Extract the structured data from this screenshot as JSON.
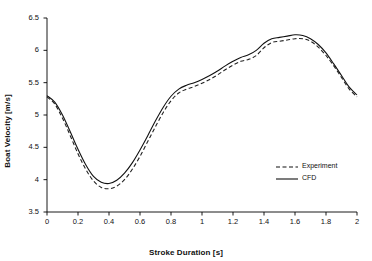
{
  "chart_data": {
    "type": "line",
    "title": "",
    "xlabel": "Stroke Duration [s]",
    "ylabel": "Boat Velocity [m/s]",
    "xlim": [
      0,
      2
    ],
    "ylim": [
      3.5,
      6.5
    ],
    "xticks": [
      "0",
      "0.2",
      "0.4",
      "0.6",
      "0.8",
      "1",
      "1.2",
      "1.4",
      "1.6",
      "1.8",
      "2"
    ],
    "yticks": [
      "3.5",
      "4",
      "4.5",
      "5",
      "5.5",
      "6",
      "6.5"
    ],
    "grid": false,
    "legend_position": "bottom-right",
    "series": [
      {
        "name": "Experiment",
        "style": "dashed",
        "color": "#222222",
        "x": [
          0,
          0.05,
          0.1,
          0.15,
          0.2,
          0.25,
          0.3,
          0.35,
          0.4,
          0.45,
          0.5,
          0.55,
          0.6,
          0.65,
          0.7,
          0.75,
          0.8,
          0.85,
          0.9,
          0.95,
          1.0,
          1.05,
          1.1,
          1.15,
          1.2,
          1.25,
          1.3,
          1.35,
          1.4,
          1.45,
          1.5,
          1.55,
          1.6,
          1.65,
          1.7,
          1.75,
          1.8,
          1.85,
          1.9,
          1.95,
          2.0
        ],
        "y": [
          5.28,
          5.17,
          4.95,
          4.68,
          4.4,
          4.16,
          3.98,
          3.88,
          3.86,
          3.9,
          4.0,
          4.16,
          4.36,
          4.59,
          4.82,
          5.04,
          5.22,
          5.34,
          5.4,
          5.44,
          5.49,
          5.55,
          5.62,
          5.7,
          5.77,
          5.83,
          5.86,
          5.92,
          6.04,
          6.12,
          6.14,
          6.16,
          6.18,
          6.18,
          6.14,
          6.05,
          5.92,
          5.76,
          5.58,
          5.4,
          5.28
        ]
      },
      {
        "name": "CFD",
        "style": "solid",
        "color": "#111111",
        "x": [
          0,
          0.05,
          0.1,
          0.15,
          0.2,
          0.25,
          0.3,
          0.35,
          0.4,
          0.45,
          0.5,
          0.55,
          0.6,
          0.65,
          0.7,
          0.75,
          0.8,
          0.85,
          0.9,
          0.95,
          1.0,
          1.05,
          1.1,
          1.15,
          1.2,
          1.25,
          1.3,
          1.35,
          1.4,
          1.45,
          1.5,
          1.55,
          1.6,
          1.65,
          1.7,
          1.75,
          1.8,
          1.85,
          1.9,
          1.95,
          2.0
        ],
        "y": [
          5.3,
          5.2,
          5.0,
          4.74,
          4.47,
          4.23,
          4.05,
          3.96,
          3.94,
          3.99,
          4.1,
          4.26,
          4.46,
          4.68,
          4.91,
          5.12,
          5.29,
          5.4,
          5.46,
          5.5,
          5.55,
          5.61,
          5.68,
          5.76,
          5.83,
          5.89,
          5.93,
          6.0,
          6.11,
          6.18,
          6.2,
          6.22,
          6.24,
          6.23,
          6.18,
          6.09,
          5.96,
          5.79,
          5.61,
          5.43,
          5.31
        ]
      }
    ]
  },
  "legend": {
    "items": [
      {
        "label": "Experiment",
        "style": "dashed"
      },
      {
        "label": "CFD",
        "style": "solid"
      }
    ]
  }
}
